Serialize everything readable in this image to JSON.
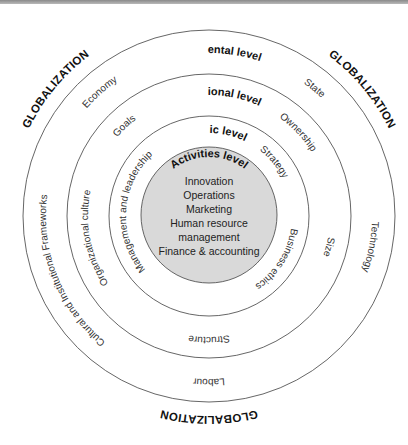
{
  "diagram": {
    "globalization_label": "GLOBALIZATION",
    "levels": {
      "environmental": {
        "label": "Environmental level",
        "factors": {
          "economy": "Economy",
          "state": "State",
          "technology": "Technology",
          "labour": "Labour",
          "cultural": "Cultural and Institutional Frameworks"
        }
      },
      "organizational": {
        "label": "Organizational level",
        "factors": {
          "goals": "Goals",
          "ownership": "Ownership",
          "size": "Size",
          "structure": "Structure",
          "culture": "Organizational culture"
        }
      },
      "strategic": {
        "label": "Strategic level",
        "factors": {
          "strategy": "Strategy",
          "business_ethics": "Business ethics",
          "management": "Management and leadership"
        }
      },
      "activities": {
        "label": "Activities level",
        "items": [
          "Innovation",
          "Operations",
          "Marketing",
          "Human resource",
          "management",
          "Finance & accounting"
        ]
      }
    },
    "colors": {
      "core_fill": "#d9d9d9",
      "ring_stroke": "#555555",
      "text": "#111111"
    }
  }
}
